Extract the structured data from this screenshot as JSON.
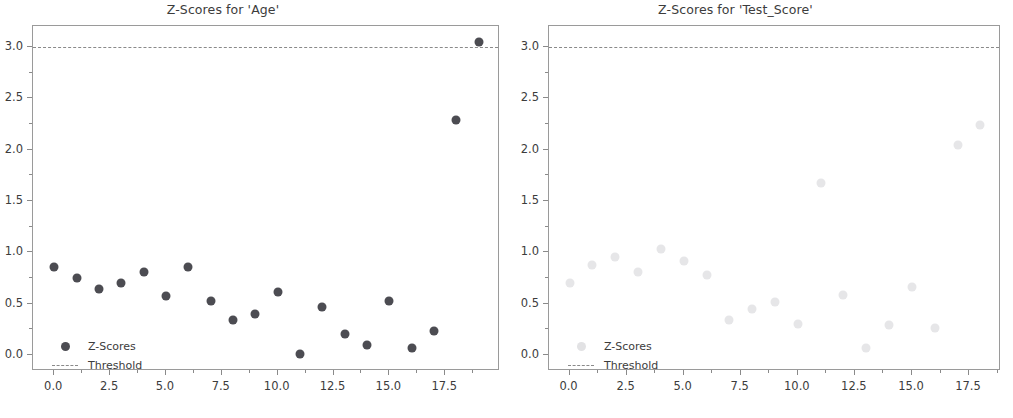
{
  "figure": {
    "background": "#ffffff",
    "width": 1013,
    "height": 418
  },
  "chart_data": [
    {
      "type": "scatter",
      "title": "Z-Scores for 'Age'",
      "xlabel": "",
      "ylabel": "",
      "xlim": [
        -0.95,
        19.95
      ],
      "ylim": [
        -0.155,
        3.205
      ],
      "grid": false,
      "legend_position": "lower left",
      "marker_color": "#4c4c52",
      "threshold_color": "#8a8a8a",
      "xticks": [
        0.0,
        2.5,
        5.0,
        7.5,
        10.0,
        12.5,
        15.0,
        17.5
      ],
      "xticklabels": [
        "0.0",
        "2.5",
        "5.0",
        "7.5",
        "10.0",
        "12.5",
        "15.0",
        "17.5"
      ],
      "yticks": [
        0.0,
        0.5,
        1.0,
        1.5,
        2.0,
        2.5,
        3.0
      ],
      "yticklabels": [
        "0.0",
        "0.5",
        "1.0",
        "1.5",
        "2.0",
        "2.5",
        "3.0"
      ],
      "series": [
        {
          "name": "Z-Scores",
          "x": [
            0,
            1,
            2,
            3,
            4,
            5,
            6,
            7,
            8,
            9,
            10,
            11,
            12,
            13,
            14,
            15,
            16,
            17,
            18,
            19
          ],
          "values": [
            0.86,
            0.75,
            0.64,
            0.7,
            0.81,
            0.58,
            0.86,
            0.53,
            0.34,
            0.4,
            0.61,
            0.01,
            0.47,
            0.21,
            0.1,
            0.53,
            0.07,
            0.23,
            2.29,
            3.05
          ]
        }
      ],
      "threshold": {
        "name": "Threshold",
        "value": 3.0
      }
    },
    {
      "type": "scatter",
      "title": "Z-Scores for 'Test_Score'",
      "xlabel": "",
      "ylabel": "",
      "xlim": [
        -0.9,
        18.9
      ],
      "ylim": [
        -0.155,
        3.205
      ],
      "grid": false,
      "legend_position": "lower left",
      "marker_color": "#e6e6e8",
      "threshold_color": "#8a8a8a",
      "xticks": [
        0.0,
        2.5,
        5.0,
        7.5,
        10.0,
        12.5,
        15.0,
        17.5
      ],
      "xticklabels": [
        "0.0",
        "2.5",
        "5.0",
        "7.5",
        "10.0",
        "12.5",
        "15.0",
        "17.5"
      ],
      "yticks": [
        0.0,
        0.5,
        1.0,
        1.5,
        2.0,
        2.5,
        3.0
      ],
      "yticklabels": [
        "0.0",
        "0.5",
        "1.0",
        "1.5",
        "2.0",
        "2.5",
        "3.0"
      ],
      "series": [
        {
          "name": "Z-Scores",
          "x": [
            0,
            1,
            2,
            3,
            4,
            5,
            6,
            7,
            8,
            9,
            10,
            11,
            12,
            13,
            14,
            15,
            16,
            17,
            18
          ],
          "values": [
            0.7,
            0.88,
            0.96,
            0.81,
            1.03,
            0.92,
            0.78,
            0.34,
            0.45,
            0.52,
            0.3,
            1.68,
            0.59,
            0.07,
            0.29,
            0.66,
            0.26,
            2.05,
            2.24
          ]
        }
      ],
      "threshold": {
        "name": "Threshold",
        "value": 3.0
      }
    }
  ],
  "legend": {
    "scores_label": "Z-Scores",
    "threshold_label": "Threshold"
  }
}
